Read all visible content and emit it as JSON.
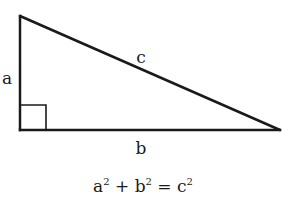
{
  "diagram": {
    "stroke_color": "#1a1a1a",
    "vertices": {
      "top": [
        20,
        16
      ],
      "right_angle": [
        20,
        130
      ],
      "right": [
        280,
        130
      ]
    },
    "right_angle_marker": {
      "x": 20,
      "y": 105,
      "size": 25
    },
    "labels": {
      "side_a": {
        "text": "a",
        "x": 7,
        "y": 78
      },
      "side_b": {
        "text": "b",
        "x": 141,
        "y": 148
      },
      "side_c": {
        "text": "c",
        "x": 141,
        "y": 57
      }
    },
    "equation": {
      "a": "a",
      "a_exp": "2",
      "plus": " + ",
      "b": "b",
      "b_exp": "2",
      "equals": " = ",
      "c": "c",
      "c_exp": "2",
      "x": 143,
      "y": 186
    }
  }
}
